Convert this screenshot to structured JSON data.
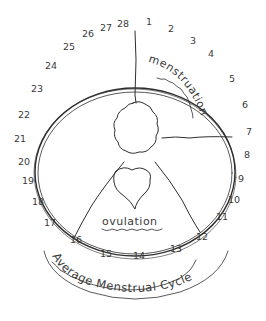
{
  "diagram": {
    "title": "Average Menstrual Cycle",
    "phases": {
      "menstruation": "menstruation",
      "ovulation": "ovulation"
    },
    "days": [
      "1",
      "2",
      "3",
      "4",
      "5",
      "6",
      "7",
      "8",
      "9",
      "10",
      "11",
      "12",
      "13",
      "14",
      "15",
      "16",
      "17",
      "18",
      "19",
      "20",
      "21",
      "22",
      "23",
      "24",
      "25",
      "26",
      "27",
      "28"
    ],
    "colors": {
      "ink": "#2e2e2e",
      "background": "#ffffff"
    }
  }
}
